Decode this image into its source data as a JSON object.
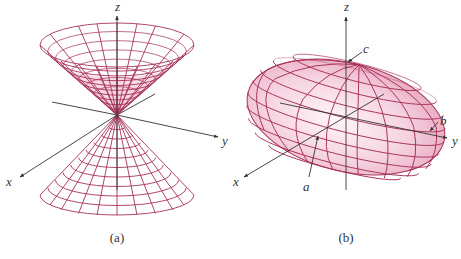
{
  "figure_a": {
    "caption": "(a)",
    "surface": "double cone",
    "axis_labels": {
      "x": "x",
      "y": "y",
      "z": "z"
    }
  },
  "figure_b": {
    "caption": "(b)",
    "surface": "ellipsoid",
    "axis_labels": {
      "x": "x",
      "y": "y",
      "z": "z"
    },
    "semi_axis_labels": {
      "a": "a",
      "b": "b",
      "c": "c"
    }
  },
  "colors": {
    "mesh": "#a8325a",
    "fill_light": "#f7dbe6",
    "fill_mid": "#eeb9cc",
    "axis": "#333333"
  }
}
